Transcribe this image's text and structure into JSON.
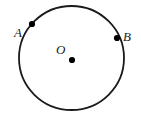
{
  "figure": {
    "type": "geometry-diagram",
    "background_color": "#ffffff",
    "stroke_color": "#1a1a1a",
    "canvas": {
      "width": 141,
      "height": 115
    },
    "circle": {
      "name": "main-circle",
      "center_x": 71.5,
      "center_y": 58,
      "radius_x": 52.5,
      "radius_y": 52,
      "stroke_width": 1.8,
      "fill": "none"
    },
    "points": [
      {
        "id": "center",
        "label": "O",
        "dot_x": 72,
        "dot_y": 60,
        "dot_radius": 3.1,
        "label_x": 56,
        "label_y": 43
      },
      {
        "id": "point-a",
        "label": "A",
        "dot_x": 32,
        "dot_y": 24,
        "dot_radius": 3.1,
        "label_x": 14,
        "label_y": 26
      },
      {
        "id": "point-b",
        "label": "B",
        "dot_x": 117,
        "dot_y": 38,
        "dot_radius": 3.1,
        "label_x": 123,
        "label_y": 30
      }
    ]
  }
}
